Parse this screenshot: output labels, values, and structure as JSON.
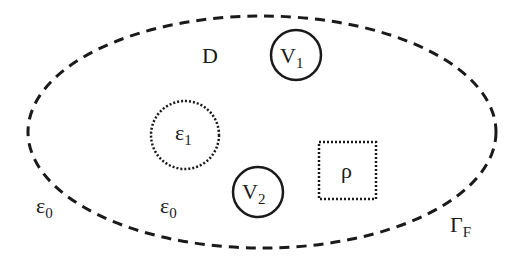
{
  "diagram": {
    "domain_label": "D",
    "boundary_label": {
      "main": "Γ",
      "sub": "F"
    },
    "outer_permittivity": {
      "main": "ε",
      "sub": "0"
    },
    "inner_permittivity": {
      "main": "ε",
      "sub": "0"
    },
    "dielectric": {
      "main": "ε",
      "sub": "1"
    },
    "electrode_1": {
      "main": "V",
      "sub": "1"
    },
    "electrode_2": {
      "main": "V",
      "sub": "2"
    },
    "charge_density": "ρ"
  },
  "colors": {
    "stroke": "#1a1a1a",
    "background": "#ffffff"
  }
}
